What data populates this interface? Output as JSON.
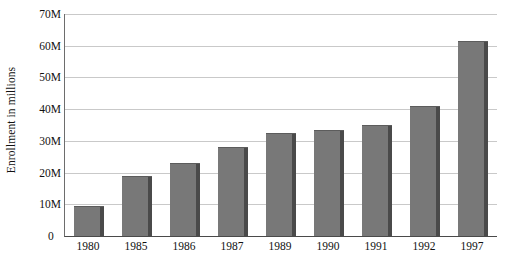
{
  "chart_data": {
    "type": "bar",
    "title": "",
    "subtitle": "",
    "xlabel": "",
    "ylabel": "Enrollment in millions",
    "categories": [
      "1980",
      "1985",
      "1986",
      "1987",
      "1989",
      "1990",
      "1991",
      "1992",
      "1997"
    ],
    "values": [
      9.5,
      19,
      23,
      28,
      32.5,
      33.5,
      35,
      41,
      61.5
    ],
    "series": [
      {
        "name": "Enrollment",
        "values": [
          9.5,
          19,
          23,
          28,
          32.5,
          33.5,
          35,
          41,
          61.5
        ]
      }
    ],
    "ylim": [
      0,
      70
    ],
    "ytick_values": [
      0,
      10,
      20,
      30,
      40,
      50,
      60,
      70
    ],
    "ytick_labels": [
      "0",
      "10M",
      "20M",
      "30M",
      "40M",
      "50M",
      "60M",
      "70M"
    ],
    "grid": "horizontal",
    "legend": "none",
    "bar_color": "#787878",
    "bar_shadow_color": "#4a4a4a",
    "gridline_color": "#c9c9c9",
    "axis_color": "#4a4a4a",
    "background_color": "#ffffff"
  }
}
